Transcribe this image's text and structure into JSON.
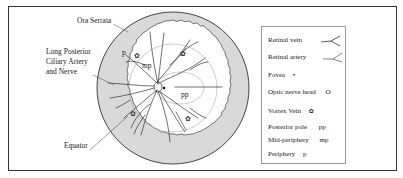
{
  "figure": {
    "labels": {
      "ora_serrata": "Ora Serrata",
      "long_posterior_line1": "Long Posterior",
      "long_posterior_line2": "Ciliary Artery",
      "long_posterior_line3": "and Nerve",
      "equator": "Equator",
      "p": "p",
      "mp": "mp",
      "pp": "pp"
    },
    "colors": {
      "ring_fill": "#d9d9d9",
      "line": "#333333",
      "zone_line": "#aaaaaa"
    }
  },
  "legend": {
    "items": [
      {
        "label": "Retinal vein",
        "symbol": "vein-branch"
      },
      {
        "label": "Retinal artery",
        "symbol": "artery-branch"
      },
      {
        "label": "Fovea",
        "symbol": "•"
      },
      {
        "label": "Optic nerve head",
        "symbol": "O"
      },
      {
        "label": "Vortex Vein",
        "symbol": "✿"
      },
      {
        "label": "Posterior pole",
        "symbol": "pp"
      },
      {
        "label": "Mid-periphery",
        "symbol": "mp"
      },
      {
        "label": "Periphery",
        "symbol": "p"
      }
    ]
  }
}
